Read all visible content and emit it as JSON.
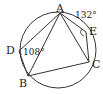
{
  "diagram": {
    "type": "inscribed-pentagon-in-circle",
    "circle": {
      "cx": 58,
      "cy": 50,
      "r": 38
    },
    "points": {
      "A": {
        "label": "A",
        "x": 60,
        "y": 13
      },
      "E": {
        "label": "E",
        "x": 86,
        "y": 32
      },
      "C": {
        "label": "C",
        "x": 89,
        "y": 62
      },
      "B": {
        "label": "B",
        "x": 28,
        "y": 76
      },
      "D": {
        "label": "D",
        "x": 20,
        "y": 51
      }
    },
    "segments": [
      "A-E",
      "E-C",
      "C-B",
      "B-D",
      "D-A",
      "A-B",
      "A-C"
    ],
    "angles": {
      "at_D": "108°",
      "at_E": "132°"
    },
    "colors": {
      "stroke": "#333333",
      "background": "#ffffff"
    }
  }
}
